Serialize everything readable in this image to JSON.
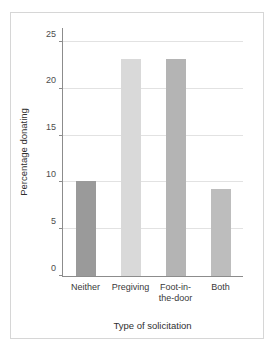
{
  "chart_data": {
    "type": "bar",
    "title": "",
    "subtitle": "",
    "xlabel": "Type of solicitation",
    "ylabel": "Percentage donating",
    "categories": [
      "Neither",
      "Pregiving",
      "Foot-in-\nthe-door",
      "Both"
    ],
    "values": [
      10.2,
      23.2,
      23.2,
      9.3
    ],
    "bar_colors": [
      "#9a9a9a",
      "#d9d9d9",
      "#b4b4b4",
      "#bdbdbd"
    ],
    "ylim": [
      0,
      26.5
    ],
    "yticks": [
      0,
      5,
      10,
      15,
      20,
      25
    ],
    "ytick_labels": [
      "0",
      "5",
      "10",
      "15",
      "20",
      "25"
    ],
    "grid": "horizontal",
    "gridline_color": "#e2e2e2",
    "axis_color": "#8c8c8c",
    "legend": "none",
    "annotations": [],
    "background_color": "#ffffff",
    "frame_color": "#d6d6d6"
  }
}
